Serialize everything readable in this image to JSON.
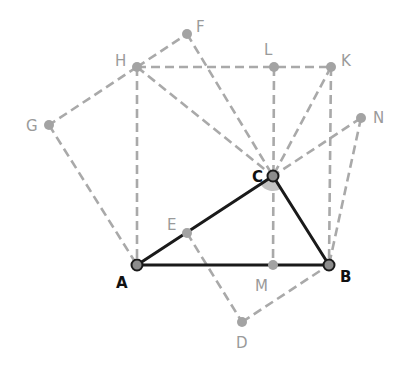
{
  "figure": {
    "title": "",
    "colors": {
      "main_line": "#1a1a1a",
      "construction_line": "#a9a9a9",
      "main_point_fill": "#8c8c8c",
      "construction_point_fill": "#a3a3a3",
      "angle_fill": "#c4c4c4",
      "main_label": "#111111",
      "construction_label": "#9a9a9a"
    },
    "points": [
      {
        "id": "A",
        "label": "A",
        "x": 137,
        "y": 265,
        "main": true,
        "lx": 116,
        "ly": 288
      },
      {
        "id": "B",
        "label": "B",
        "x": 329,
        "y": 265,
        "main": true,
        "lx": 340,
        "ly": 282
      },
      {
        "id": "C",
        "label": "C",
        "x": 273,
        "y": 176,
        "main": true,
        "lx": 252,
        "ly": 182
      },
      {
        "id": "E",
        "label": "E",
        "x": 187,
        "y": 233,
        "main": false,
        "lx": 167,
        "ly": 230
      },
      {
        "id": "D",
        "label": "D",
        "x": 242,
        "y": 322,
        "main": false,
        "lx": 236,
        "ly": 348
      },
      {
        "id": "M",
        "label": "M",
        "x": 273,
        "y": 265,
        "main": false,
        "lx": 255,
        "ly": 291
      },
      {
        "id": "H",
        "label": "H",
        "x": 137,
        "y": 67,
        "main": false,
        "lx": 115,
        "ly": 66
      },
      {
        "id": "F",
        "label": "F",
        "x": 187,
        "y": 34,
        "main": false,
        "lx": 196,
        "ly": 32
      },
      {
        "id": "G",
        "label": "G",
        "x": 49,
        "y": 125,
        "main": false,
        "lx": 26,
        "ly": 131
      },
      {
        "id": "L",
        "label": "L",
        "x": 274,
        "y": 67,
        "main": false,
        "lx": 264,
        "ly": 55
      },
      {
        "id": "K",
        "label": "K",
        "x": 331,
        "y": 67,
        "main": false,
        "lx": 341,
        "ly": 66
      },
      {
        "id": "N",
        "label": "N",
        "x": 361,
        "y": 118,
        "main": false,
        "lx": 373,
        "ly": 123
      }
    ],
    "solid_segments": [
      [
        "A",
        "B"
      ],
      [
        "A",
        "C"
      ],
      [
        "C",
        "B"
      ]
    ],
    "dashed_segments": [
      [
        "H",
        "K"
      ],
      [
        "H",
        "A"
      ],
      [
        "K",
        "B"
      ],
      [
        "L",
        "M"
      ],
      [
        "H",
        "C"
      ],
      [
        "F",
        "C"
      ],
      [
        "K",
        "C"
      ],
      [
        "N",
        "C"
      ],
      [
        "H",
        "F"
      ],
      [
        "H",
        "G"
      ],
      [
        "G",
        "A"
      ],
      [
        "E",
        "D"
      ],
      [
        "D",
        "B"
      ],
      [
        "N",
        "B"
      ]
    ],
    "angle_marker": {
      "vertex": "C",
      "from": "A",
      "to": "B",
      "radius": 15
    }
  }
}
